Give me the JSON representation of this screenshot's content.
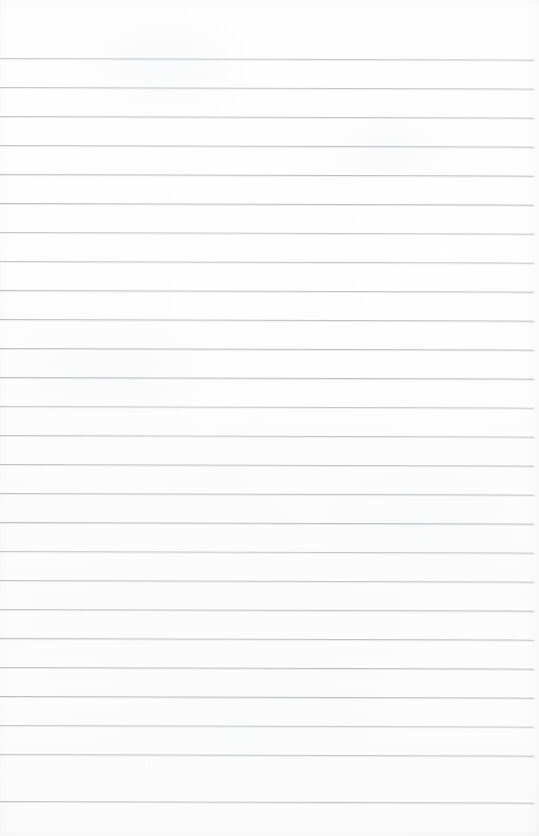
{
  "document": {
    "kind": "scanned-ruled-notebook-page",
    "title": "Blank Lined Notebook Page",
    "content_text": "",
    "has_written_content": false,
    "page_number_text": "",
    "header_text": "",
    "footer_text": ""
  },
  "canvas": {
    "width": 539,
    "height": 836,
    "paper_color": "#fdfdfd",
    "paper_edge_color": "#ffffff"
  },
  "ruling": {
    "line_color": "#b9bcc0",
    "line_thickness": 1,
    "line_spacing": 29,
    "first_line_y": 58,
    "last_line_y": 801,
    "line_start_x": 0,
    "line_end_x": 534,
    "skew_degrees": 0.18,
    "line_count": 26,
    "line_y_positions": [
      58,
      87,
      116,
      145,
      174,
      203,
      232,
      261,
      290,
      319,
      348,
      377,
      406,
      435,
      464,
      493,
      522,
      551,
      580,
      609,
      638,
      667,
      696,
      725,
      754,
      801
    ],
    "top_margin_label": "top margin",
    "bottom_margin_label": "bottom margin",
    "margin_rule_present": false
  }
}
